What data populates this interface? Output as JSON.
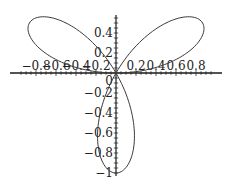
{
  "chart_data": {
    "type": "line",
    "subtype": "polar-rose",
    "title": "",
    "xlabel": "",
    "ylabel": "",
    "equation": "r = sin(3θ)",
    "series": [
      {
        "name": "rose",
        "color": "#3a3a3a",
        "theta_range": [
          0,
          3.14159
        ],
        "samples": 240
      }
    ],
    "xlim": [
      -0.95,
      0.98
    ],
    "ylim": [
      -1.0,
      0.58
    ],
    "x_ticks": [
      -0.8,
      -0.6,
      -0.4,
      -0.2,
      0.2,
      0.4,
      0.6,
      0.8
    ],
    "x_tick_labels": [
      "-0.8",
      "-0.6",
      "-0.4",
      "-0.2",
      "0.2",
      "0.4",
      "0.6",
      "0.8"
    ],
    "y_ticks": [
      0.4,
      0.2,
      -0.2,
      -0.4,
      -0.6,
      -0.8,
      -1
    ],
    "y_tick_labels": [
      "0.4",
      "0.2",
      "-0.2",
      "-0.4",
      "-0.6",
      "-0.8",
      "-1"
    ],
    "origin_label": "0",
    "grid": false,
    "legend": "none",
    "petals": [
      {
        "direction_deg": 30,
        "tip": [
          0.866,
          0.5
        ]
      },
      {
        "direction_deg": 150,
        "tip": [
          -0.866,
          0.5
        ]
      },
      {
        "direction_deg": 270,
        "tip": [
          0,
          -1
        ]
      }
    ]
  },
  "layout": {
    "origin_px": [
      116,
      73
    ],
    "px_per_unit": 100,
    "x_axis_px": [
      10,
      222
    ],
    "y_axis_px": [
      15,
      176
    ],
    "axis_color": "#1a1a1a"
  }
}
